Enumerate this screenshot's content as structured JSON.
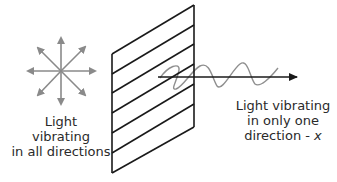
{
  "diagram": {
    "labels": {
      "unpolarized": [
        "Light",
        "vibrating",
        "in all directions"
      ],
      "polarized": [
        "Light vibrating",
        "in only one",
        "direction - "
      ],
      "polarized_axis_symbol": "x"
    },
    "colors": {
      "filter_lines": "#1a1a1a",
      "star_arrows": "#8a8a8a",
      "wave": "#8f8f8f",
      "axis": "#1a1a1a",
      "text": "#2a2a2a"
    },
    "elements": {
      "star_arrows_count": 8,
      "filter_slats_count": 7
    }
  }
}
